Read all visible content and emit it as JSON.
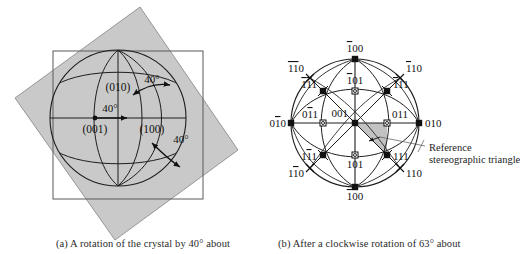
{
  "figure": {
    "background": "#ffffff",
    "ink": "#222222",
    "shade_color": "#c9c9c9",
    "shade_color_triangle": "#bdbdbd"
  },
  "panel_a": {
    "name": "rotated-crystal-sphere",
    "caption": "(a)  A rotation of the crystal by 40° about",
    "angle_labels": [
      {
        "text": "40°",
        "position": "top-right"
      },
      {
        "text": "40°",
        "position": "center-left"
      },
      {
        "text": "40°",
        "position": "bottom-right"
      }
    ],
    "pole_labels": [
      {
        "text": "(010)",
        "position": "top-center"
      },
      {
        "text": "(001)",
        "position": "left-center"
      },
      {
        "text": "(100)",
        "position": "right-center"
      }
    ]
  },
  "panel_b": {
    "name": "stereographic-projection",
    "caption": "(b)  After a clockwise rotation of 63° about",
    "annotation": {
      "line1": "Reference",
      "line2": "stereographic  triangle"
    },
    "poles": [
      {
        "id": "m100",
        "label": "100",
        "bars": [
          1,
          0,
          0
        ],
        "marker": "filled-square",
        "x": 355,
        "y": 187,
        "lx": 355,
        "ly": 200,
        "anchor": "middle"
      },
      {
        "id": "bar100",
        "label": "100",
        "bars": [
          1,
          0,
          0
        ],
        "marker": "filled-square",
        "x": 355,
        "y": 59,
        "lx": 355,
        "ly": 52,
        "anchor": "middle"
      },
      {
        "id": "010",
        "label": "010",
        "bars": [
          0,
          0,
          0
        ],
        "marker": "filled-square",
        "x": 419,
        "y": 123,
        "lx": 425,
        "ly": 127,
        "anchor": "start"
      },
      {
        "id": "0bar10",
        "label": "010",
        "bars": [
          0,
          1,
          0
        ],
        "marker": "filled-square",
        "x": 291,
        "y": 123,
        "lx": 286,
        "ly": 127,
        "anchor": "end"
      },
      {
        "id": "001",
        "label": "001",
        "bars": [
          0,
          0,
          0
        ],
        "marker": "filled-square",
        "x": 355,
        "y": 123,
        "lx": 348,
        "ly": 117,
        "anchor": "end"
      },
      {
        "id": "bar101",
        "label": "101",
        "bars": [
          1,
          0,
          0
        ],
        "marker": "open-circle",
        "x": 355,
        "y": 91,
        "lx": 355,
        "ly": 84,
        "anchor": "middle"
      },
      {
        "id": "101",
        "label": "101",
        "bars": [
          0,
          0,
          0
        ],
        "marker": "open-circle",
        "x": 355,
        "y": 155,
        "lx": 355,
        "ly": 168,
        "anchor": "middle"
      },
      {
        "id": "011",
        "label": "011",
        "bars": [
          0,
          0,
          0
        ],
        "marker": "open-circle",
        "x": 387,
        "y": 123,
        "lx": 392,
        "ly": 118,
        "anchor": "start"
      },
      {
        "id": "0bar11",
        "label": "011",
        "bars": [
          0,
          1,
          0
        ],
        "marker": "open-circle",
        "x": 323,
        "y": 123,
        "lx": 318,
        "ly": 118,
        "anchor": "end"
      },
      {
        "id": "bar111",
        "label": "111",
        "bars": [
          1,
          0,
          0
        ],
        "marker": "cross-square",
        "x": 387,
        "y": 91,
        "lx": 393,
        "ly": 88,
        "anchor": "start"
      },
      {
        "id": "barbar111",
        "label": "111",
        "bars": [
          1,
          1,
          0
        ],
        "marker": "cross-square",
        "x": 323,
        "y": 91,
        "lx": 317,
        "ly": 88,
        "anchor": "end"
      },
      {
        "id": "111",
        "label": "111",
        "bars": [
          0,
          0,
          0
        ],
        "marker": "cross-square",
        "x": 387,
        "y": 155,
        "lx": 393,
        "ly": 160,
        "anchor": "start"
      },
      {
        "id": "1bar11",
        "label": "111",
        "bars": [
          0,
          1,
          0
        ],
        "marker": "cross-square",
        "x": 323,
        "y": 155,
        "lx": 317,
        "ly": 160,
        "anchor": "end"
      },
      {
        "id": "bar110",
        "label": "110",
        "bars": [
          1,
          0,
          0
        ],
        "marker": "cross-small",
        "x": 400,
        "y": 78,
        "lx": 406,
        "ly": 72,
        "anchor": "start"
      },
      {
        "id": "barbar110",
        "label": "110",
        "bars": [
          1,
          1,
          0
        ],
        "marker": "cross-small",
        "x": 310,
        "y": 78,
        "lx": 304,
        "ly": 72,
        "anchor": "end"
      },
      {
        "id": "110",
        "label": "110",
        "bars": [
          0,
          0,
          0
        ],
        "marker": "cross-small",
        "x": 400,
        "y": 168,
        "lx": 406,
        "ly": 177,
        "anchor": "start"
      },
      {
        "id": "1bar10",
        "label": "110",
        "bars": [
          0,
          1,
          0
        ],
        "marker": "cross-small",
        "x": 310,
        "y": 168,
        "lx": 304,
        "ly": 177,
        "anchor": "end"
      }
    ]
  }
}
